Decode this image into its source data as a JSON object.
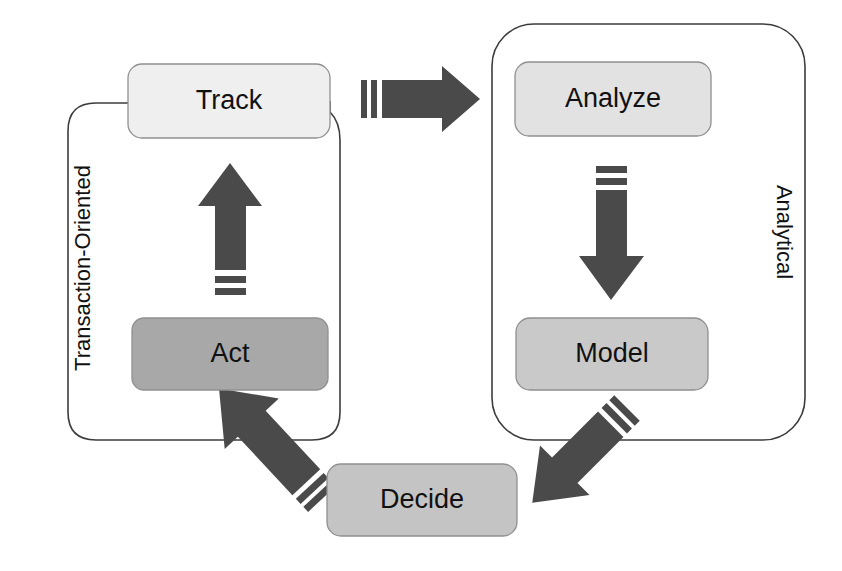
{
  "diagram": {
    "canvas": {
      "width": 842,
      "height": 571,
      "background": "#ffffff"
    },
    "palette": {
      "arrow_fill": "#4a4a4a",
      "outline_stroke": "#3c3c3c",
      "node_stroke": "#909090",
      "text_color": "#111111"
    },
    "groups": [
      {
        "id": "transaction-oriented",
        "label": "Transaction-Oriented",
        "label_orientation": "rotated-90-ccw",
        "label_x": 84,
        "label_y": 268,
        "outline_color": "#3c3c3c"
      },
      {
        "id": "analytical",
        "label": "Analytical",
        "label_orientation": "rotated-90-cw",
        "label_x": 783,
        "label_y": 232,
        "outline_color": "#3c3c3c"
      }
    ],
    "nodes": [
      {
        "id": "track",
        "label": "Track",
        "fill": "#efefef",
        "x": 128,
        "y": 64,
        "width": 202,
        "height": 74,
        "rx": 14,
        "label_x": 229,
        "label_y": 101
      },
      {
        "id": "act",
        "label": "Act",
        "fill": "#a8a8a8",
        "x": 132,
        "y": 318,
        "width": 196,
        "height": 72,
        "rx": 12,
        "label_x": 230,
        "label_y": 354
      },
      {
        "id": "analyze",
        "label": "Analyze",
        "fill": "#e2e2e2",
        "x": 515,
        "y": 62,
        "width": 196,
        "height": 74,
        "rx": 14,
        "label_x": 613,
        "label_y": 99
      },
      {
        "id": "model",
        "label": "Model",
        "fill": "#c9c9c9",
        "x": 516,
        "y": 318,
        "width": 192,
        "height": 72,
        "rx": 14,
        "label_x": 612,
        "label_y": 354
      },
      {
        "id": "decide",
        "label": "Decide",
        "fill": "#c4c4c4",
        "x": 327,
        "y": 464,
        "width": 190,
        "height": 72,
        "rx": 14,
        "label_x": 422,
        "label_y": 500
      }
    ],
    "arrows": [
      {
        "id": "track-to-analyze",
        "from": "track",
        "to": "analyze",
        "direction": "right",
        "fill": "#4a4a4a"
      },
      {
        "id": "act-to-track",
        "from": "act",
        "to": "track",
        "direction": "up",
        "fill": "#4a4a4a"
      },
      {
        "id": "analyze-to-model",
        "from": "analyze",
        "to": "model",
        "direction": "down",
        "fill": "#4a4a4a"
      },
      {
        "id": "model-to-decide",
        "from": "model",
        "to": "decide",
        "direction": "down-left",
        "fill": "#4a4a4a"
      },
      {
        "id": "decide-to-act",
        "from": "decide",
        "to": "act",
        "direction": "up-left",
        "fill": "#4a4a4a"
      }
    ],
    "cycle_sequence": [
      "Track",
      "Analyze",
      "Model",
      "Decide",
      "Act"
    ]
  }
}
